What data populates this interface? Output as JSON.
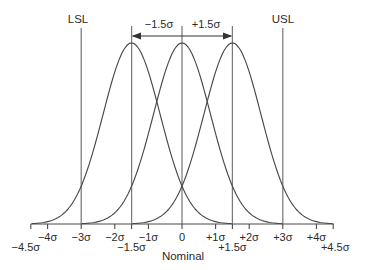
{
  "chart_data": {
    "type": "line",
    "xlabel": "Nominal",
    "upper_labels": {
      "lsl": "LSL",
      "usl": "USL"
    },
    "shift_annotation": {
      "left": "−1.5σ",
      "right": "+1.5σ",
      "from_sigma": -1.5,
      "to_sigma": 1.5
    },
    "curves": [
      {
        "name": "shifted-left-distribution",
        "mean": -1.5,
        "sigma": 1,
        "peak": 1
      },
      {
        "name": "centered-distribution",
        "mean": 0,
        "sigma": 1,
        "peak": 1
      },
      {
        "name": "shifted-right-distribution",
        "mean": 1.5,
        "sigma": 1,
        "peak": 1
      }
    ],
    "reference_lines": [
      {
        "name": "lsl-line",
        "x": -3
      },
      {
        "name": "minus-1p5-sigma-line",
        "x": -1.5
      },
      {
        "name": "nominal-line",
        "x": 0
      },
      {
        "name": "plus-1p5-sigma-line",
        "x": 1.5
      },
      {
        "name": "usl-line",
        "x": 3
      }
    ],
    "x_axis": {
      "range_sigma": [
        -4.5,
        4.5
      ],
      "axis_label": "Nominal",
      "ticks_row1": [
        {
          "x": -4,
          "label": "−4σ"
        },
        {
          "x": -3,
          "label": "−3σ"
        },
        {
          "x": -2,
          "label": "−2σ"
        },
        {
          "x": -1,
          "label": "−1σ"
        },
        {
          "x": 0,
          "label": "0"
        },
        {
          "x": 1,
          "label": "+1σ"
        },
        {
          "x": 2,
          "label": "+2σ"
        },
        {
          "x": 3,
          "label": "+3σ"
        },
        {
          "x": 4,
          "label": "+4σ"
        }
      ],
      "ticks_row2": [
        {
          "x": -4.5,
          "label": "−4.5σ"
        },
        {
          "x": -1.5,
          "label": "−1.5σ"
        },
        {
          "x": 1.5,
          "label": "+1.5σ"
        },
        {
          "x": 4.5,
          "label": "+4.5σ"
        }
      ]
    },
    "colors": {
      "curve": "#4a4a4a",
      "reference_line": "#7a7a7a",
      "axis": "#4a4a4a",
      "text": "#2b2b2b",
      "background": "#ffffff"
    }
  }
}
